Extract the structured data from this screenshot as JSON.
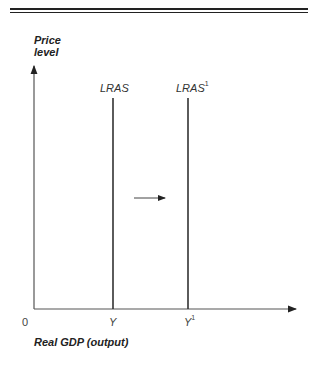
{
  "diagram": {
    "type": "economics-supply-shift",
    "y_axis_label": [
      "Price",
      "level"
    ],
    "x_axis_label": "Real GDP (output)",
    "origin_label": "0",
    "curves": [
      {
        "name": "LRAS",
        "label": "LRAS",
        "superscript": "",
        "x_tick": "Y",
        "x_tick_sup": ""
      },
      {
        "name": "LRAS1",
        "label": "LRAS",
        "superscript": "1",
        "x_tick": "Y",
        "x_tick_sup": "1"
      }
    ],
    "shift_arrow": {
      "direction": "right",
      "meaning": "LRAS shifts right from Y to Y1"
    }
  }
}
